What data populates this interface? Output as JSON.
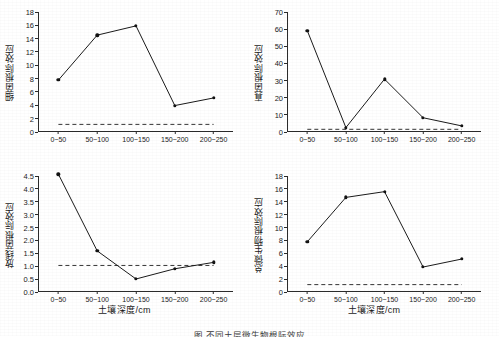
{
  "figure": {
    "xaxis_title": "土壤深度/cm",
    "caption_partial": "图  不同土层微生物根际效应"
  },
  "chart_data": [
    {
      "type": "line",
      "title": "",
      "panel": "top-left",
      "xlabel": "土壤深度/cm",
      "ylabel": "细菌根际效应",
      "categories": [
        "0~50",
        "50~100",
        "100~150",
        "150~200",
        "200~250"
      ],
      "values": [
        7.7,
        14.5,
        15.9,
        3.85,
        5.0
      ],
      "ylim": [
        0,
        18
      ],
      "yticks": [
        0,
        2,
        4,
        6,
        8,
        10,
        12,
        14,
        16,
        18
      ],
      "reference_line": 1,
      "grid": false,
      "legend": "none",
      "marker": "filled-circle"
    },
    {
      "type": "line",
      "title": "",
      "panel": "top-right",
      "xlabel": "土壤深度/cm",
      "ylabel": "真菌根际效应",
      "categories": [
        "0~50",
        "50~100",
        "100~150",
        "150~200",
        "200~250"
      ],
      "values": [
        59.0,
        2.0,
        30.5,
        7.8,
        3.0
      ],
      "ylim": [
        0,
        70
      ],
      "yticks": [
        0,
        10,
        20,
        30,
        40,
        50,
        60,
        70
      ],
      "reference_line": 1,
      "grid": false,
      "legend": "none",
      "marker": "filled-circle"
    },
    {
      "type": "line",
      "title": "",
      "panel": "bottom-left",
      "xlabel": "土壤深度/cm",
      "ylabel": "放线菌根际效应",
      "categories": [
        "0~50",
        "50~100",
        "100~150",
        "150~200",
        "200~250"
      ],
      "values": [
        4.57,
        1.57,
        0.47,
        0.87,
        1.12
      ],
      "ylim": [
        0,
        4.5
      ],
      "yticks": [
        0.0,
        0.5,
        1.0,
        1.5,
        2.0,
        2.5,
        3.0,
        3.5,
        4.0,
        4.5
      ],
      "ytick_labels": [
        "0.0",
        "0.5",
        "1.0",
        "1.5",
        "2.0",
        "2.5",
        "3.0",
        "3.5",
        "4.0",
        "4.5"
      ],
      "reference_line": 1,
      "grid": false,
      "legend": "none",
      "marker": "filled-circle"
    },
    {
      "type": "line",
      "title": "",
      "panel": "bottom-right",
      "xlabel": "土壤深度/cm",
      "ylabel": "总微生物根际效应",
      "categories": [
        "0~50",
        "50~100",
        "100~150",
        "150~200",
        "200~250"
      ],
      "values": [
        7.7,
        14.65,
        15.55,
        3.75,
        5.0
      ],
      "ylim": [
        0,
        18
      ],
      "yticks": [
        0,
        2,
        4,
        6,
        8,
        10,
        12,
        14,
        16,
        18
      ],
      "reference_line": 1,
      "grid": false,
      "legend": "none",
      "marker": "filled-circle"
    }
  ]
}
